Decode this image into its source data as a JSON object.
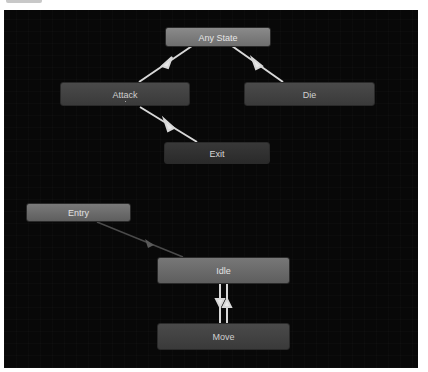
{
  "canvas": {
    "background": "#080808"
  },
  "nodes": {
    "any_state": {
      "label": "Any State"
    },
    "attack": {
      "label": "Attack"
    },
    "die": {
      "label": "Die"
    },
    "exit": {
      "label": "Exit"
    },
    "entry": {
      "label": "Entry"
    },
    "idle": {
      "label": "Idle"
    },
    "move": {
      "label": "Move"
    }
  },
  "transitions": [
    {
      "from": "Any State",
      "to": "Attack"
    },
    {
      "from": "Any State",
      "to": "Die"
    },
    {
      "from": "Attack",
      "to": "Exit"
    },
    {
      "from": "Entry",
      "to": "Idle"
    },
    {
      "from": "Idle",
      "to": "Move"
    },
    {
      "from": "Move",
      "to": "Idle"
    }
  ]
}
